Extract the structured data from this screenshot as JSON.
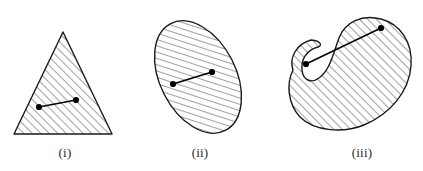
{
  "page": {
    "width": 423,
    "height": 171,
    "background_color": "#ffffff",
    "stroke_color": "#1a1a1a",
    "hatch_color": "#2b2b2b",
    "dot_color": "#000000"
  },
  "figures": [
    {
      "id": "triangle",
      "caption": "(i)",
      "shape_name": "hatched-triangle",
      "convex": true,
      "segment_inside": true,
      "vertices": [
        [
          63,
          32
        ],
        [
          112,
          134
        ],
        [
          14,
          134
        ]
      ],
      "points": [
        [
          39,
          107
        ],
        [
          76,
          100
        ]
      ]
    },
    {
      "id": "ellipse",
      "caption": "(ii)",
      "shape_name": "hatched-ellipse",
      "convex": true,
      "segment_inside": true,
      "center": [
        198,
        77
      ],
      "radius_x": 38,
      "radius_y": 60,
      "rotation_deg": -27,
      "points": [
        [
          173,
          84
        ],
        [
          212,
          72
        ]
      ]
    },
    {
      "id": "kidney",
      "caption": "(iii)",
      "shape_name": "hatched-kidney-region",
      "convex": false,
      "segment_inside": false,
      "points": [
        [
          306,
          64
        ],
        [
          381,
          28
        ]
      ]
    }
  ],
  "hatching": {
    "angle_deg": 45,
    "spacing_px": 6,
    "line_width_px": 0.9
  }
}
